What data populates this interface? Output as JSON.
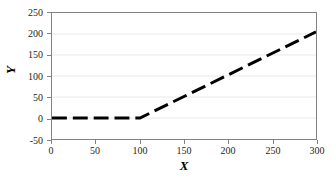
{
  "chart_data": {
    "type": "line",
    "title": "",
    "xlabel": "X",
    "ylabel": "Y",
    "xlim": [
      0,
      300
    ],
    "ylim": [
      -50,
      250
    ],
    "x_ticks": [
      0,
      50,
      100,
      150,
      200,
      250,
      300
    ],
    "y_ticks": [
      -50,
      0,
      50,
      100,
      150,
      200,
      250
    ],
    "x_tick_labels": [
      "0",
      "50",
      "100",
      "150",
      "200",
      "250",
      "300"
    ],
    "y_tick_labels": [
      "-50",
      "0",
      "50",
      "100",
      "150",
      "200",
      "250"
    ],
    "grid": true,
    "grid_axis": "y",
    "legend": false,
    "series": [
      {
        "name": "series-1",
        "style": "dashed",
        "color": "#000000",
        "line_width": 3,
        "x": [
          0,
          100,
          300
        ],
        "y": [
          0,
          0,
          205
        ],
        "points": [
          {
            "x": 0,
            "y": 0
          },
          {
            "x": 25,
            "y": 0
          },
          {
            "x": 50,
            "y": 0
          },
          {
            "x": 75,
            "y": 0
          },
          {
            "x": 100,
            "y": 0
          },
          {
            "x": 125,
            "y": 26
          },
          {
            "x": 150,
            "y": 51
          },
          {
            "x": 175,
            "y": 77
          },
          {
            "x": 200,
            "y": 103
          },
          {
            "x": 225,
            "y": 128
          },
          {
            "x": 250,
            "y": 154
          },
          {
            "x": 275,
            "y": 180
          },
          {
            "x": 300,
            "y": 205
          }
        ]
      }
    ]
  },
  "style": {
    "background": "#ffffff",
    "plot_border": "#808285",
    "gridline_color": "#e8e8e8",
    "line_color": "#000000",
    "tick_color": "#808285",
    "text_color": "#231f20"
  }
}
